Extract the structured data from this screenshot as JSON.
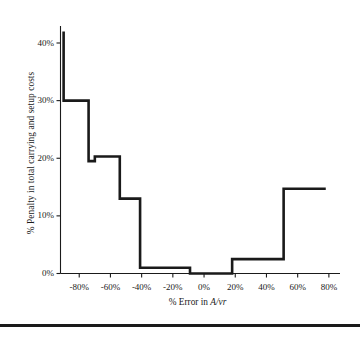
{
  "chart_data": {
    "type": "line",
    "subtype": "step",
    "title": "",
    "xlabel": "% Error in A/vr",
    "xlabel_parts": {
      "prefix": "% Error in ",
      "italic": "A/vr"
    },
    "ylabel": "% Penalty in total carrying and setup costs",
    "xlim": [
      -92,
      82
    ],
    "ylim": [
      -1.5,
      44
    ],
    "xticks": [
      -80,
      -60,
      -40,
      -20,
      0,
      20,
      40,
      60,
      80
    ],
    "xtick_labels": [
      "-80%",
      "-60%",
      "-40%",
      "-20%",
      "0%",
      "20%",
      "40%",
      "60%",
      "80%"
    ],
    "yticks": [
      0,
      10,
      20,
      30,
      40
    ],
    "ytick_labels": [
      "0%",
      "10%",
      "20%",
      "30%",
      "40%"
    ],
    "grid": false,
    "legend": false,
    "line_color": "#1a1a1a",
    "line_width": 2.6,
    "steps": [
      {
        "x_start": -90,
        "x_end": -90,
        "y": 42.0
      },
      {
        "x_start": -90,
        "x_end": -74,
        "y": 30.0
      },
      {
        "x_start": -74,
        "x_end": -70,
        "y": 19.5
      },
      {
        "x_start": -70,
        "x_end": -54,
        "y": 20.3
      },
      {
        "x_start": -54,
        "x_end": -41,
        "y": 13.0
      },
      {
        "x_start": -41,
        "x_end": -9,
        "y": 1.0
      },
      {
        "x_start": -9,
        "x_end": 18,
        "y": 0.0
      },
      {
        "x_start": 18,
        "x_end": 51,
        "y": 2.5
      },
      {
        "x_start": 51,
        "x_end": 78,
        "y": 14.7
      }
    ],
    "points": [
      {
        "x": -90,
        "y": 42.0
      },
      {
        "x": -90,
        "y": 30.0
      },
      {
        "x": -74,
        "y": 30.0
      },
      {
        "x": -74,
        "y": 19.5
      },
      {
        "x": -70,
        "y": 19.5
      },
      {
        "x": -70,
        "y": 20.3
      },
      {
        "x": -54,
        "y": 20.3
      },
      {
        "x": -54,
        "y": 13.0
      },
      {
        "x": -41,
        "y": 13.0
      },
      {
        "x": -41,
        "y": 1.0
      },
      {
        "x": -9,
        "y": 1.0
      },
      {
        "x": -9,
        "y": 0.0
      },
      {
        "x": 18,
        "y": 0.0
      },
      {
        "x": 18,
        "y": 2.5
      },
      {
        "x": 51,
        "y": 2.5
      },
      {
        "x": 51,
        "y": 14.7
      },
      {
        "x": 78,
        "y": 14.7
      }
    ]
  }
}
